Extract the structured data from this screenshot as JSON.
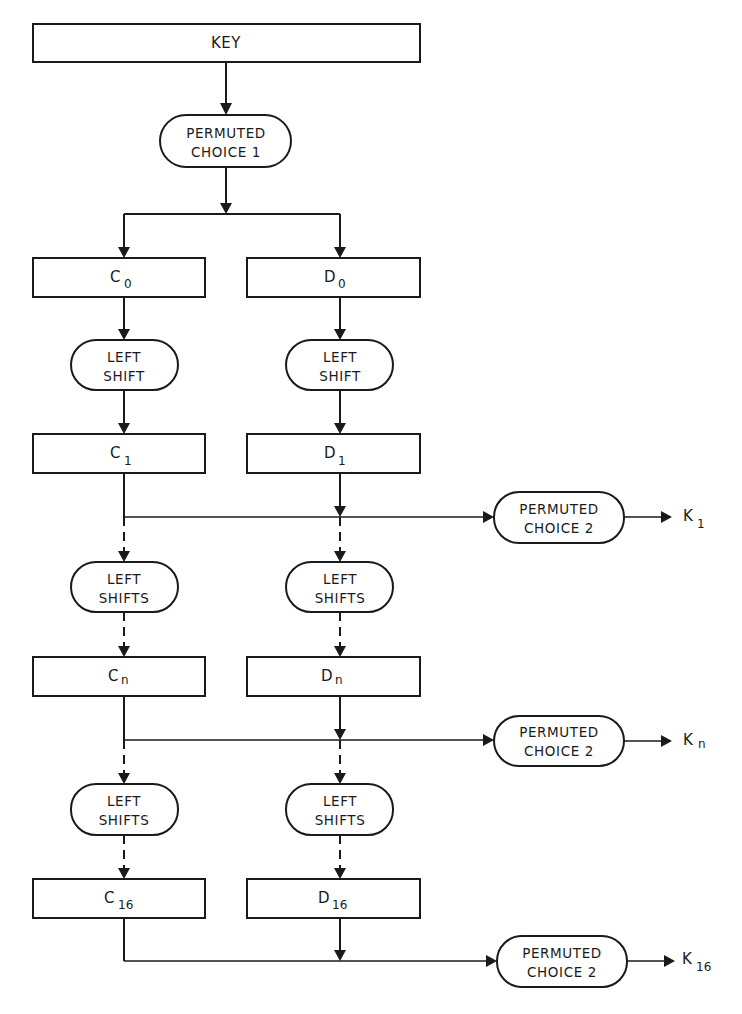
{
  "diagram": {
    "key": {
      "label": "KEY"
    },
    "pc1": {
      "line1": "PERMUTED",
      "line2": "CHOICE 1"
    },
    "columns": {
      "c": {
        "registers": [
          {
            "base": "C",
            "sub": "0"
          },
          {
            "base": "C",
            "sub": "1"
          },
          {
            "base": "C",
            "sub": "n"
          },
          {
            "base": "C",
            "sub": "16"
          }
        ]
      },
      "d": {
        "registers": [
          {
            "base": "D",
            "sub": "0"
          },
          {
            "base": "D",
            "sub": "1"
          },
          {
            "base": "D",
            "sub": "n"
          },
          {
            "base": "D",
            "sub": "16"
          }
        ]
      }
    },
    "shifts": [
      {
        "line1": "LEFT",
        "line2": "SHIFT"
      },
      {
        "line1": "LEFT",
        "line2": "SHIFTS"
      },
      {
        "line1": "LEFT",
        "line2": "SHIFTS"
      }
    ],
    "pc2": [
      {
        "line1": "PERMUTED",
        "line2": "CHOICE 2",
        "output": {
          "base": "K",
          "sub": "1"
        }
      },
      {
        "line1": "PERMUTED",
        "line2": "CHOICE 2",
        "output": {
          "base": "K",
          "sub": "n"
        }
      },
      {
        "line1": "PERMUTED",
        "line2": "CHOICE 2",
        "output": {
          "base": "K",
          "sub": "16"
        }
      }
    ],
    "colors": {
      "ink": "#1a1a1a",
      "background": "#ffffff"
    }
  }
}
